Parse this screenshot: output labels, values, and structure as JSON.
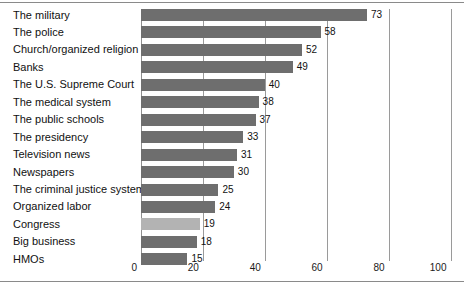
{
  "chart_data": {
    "type": "bar",
    "orientation": "horizontal",
    "title": "",
    "subtitle": "",
    "xlabel": "",
    "ylabel": "",
    "xlim": [
      0,
      100
    ],
    "grid": true,
    "legend": null,
    "xticks": [
      "0",
      "20",
      "40",
      "60",
      "80",
      "100"
    ],
    "xtick_values": [
      0,
      20,
      40,
      60,
      80,
      100
    ],
    "categories": [
      "The military",
      "The police",
      "Church/organized religion",
      "Banks",
      "The U.S. Supreme Court",
      "The medical system",
      "The public schools",
      "The presidency",
      "Television news",
      "Newspapers",
      "The criminal justice system",
      "Organized labor",
      "Congress",
      "Big business",
      "HMOs"
    ],
    "values": [
      73,
      58,
      52,
      49,
      40,
      38,
      37,
      33,
      31,
      30,
      25,
      24,
      19,
      18,
      15
    ],
    "value_labels": [
      "73",
      "58",
      "52",
      "49",
      "40",
      "38",
      "37",
      "33",
      "31",
      "30",
      "25",
      "24",
      "19",
      "18",
      "15"
    ],
    "highlight_category": "Congress",
    "colors": {
      "bar": "#6e6e6e",
      "bar_highlight": "#b3b3b3",
      "gridline": "#9a9a9a",
      "frame": "#8a8a8a",
      "text": "#111111",
      "background": "#ffffff"
    }
  }
}
